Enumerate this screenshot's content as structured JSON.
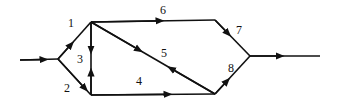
{
  "diagram": {
    "type": "directed-network",
    "colors": {
      "line": "#111111",
      "background": "#ffffff"
    },
    "edges": [
      {
        "id": "input",
        "label": ""
      },
      {
        "id": "1",
        "label": "1"
      },
      {
        "id": "2",
        "label": "2"
      },
      {
        "id": "3",
        "label": "3"
      },
      {
        "id": "4",
        "label": "4"
      },
      {
        "id": "5",
        "label": "5"
      },
      {
        "id": "6",
        "label": "6"
      },
      {
        "id": "7",
        "label": "7"
      },
      {
        "id": "8",
        "label": "8"
      },
      {
        "id": "output",
        "label": ""
      }
    ]
  }
}
